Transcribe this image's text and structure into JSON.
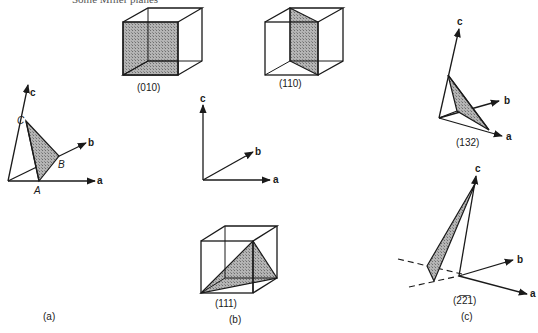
{
  "top_text": "Some Miller planes",
  "panel_a": {
    "caption": "(a)",
    "axes": {
      "a": "a",
      "b": "b",
      "c": "c"
    },
    "points": {
      "A": "A",
      "B": "B",
      "C": "C"
    }
  },
  "panel_b": {
    "caption": "(b)",
    "axes": {
      "a": "a",
      "b": "b",
      "c": "c"
    },
    "planes": [
      {
        "label": "(010)"
      },
      {
        "label": "(110)"
      },
      {
        "label": "(111)"
      }
    ]
  },
  "panel_c": {
    "caption": "(c)",
    "planes": [
      {
        "label": "(132)",
        "axes": {
          "a": "a",
          "b": "b",
          "c": "c"
        }
      },
      {
        "label": "(2̅2̅1)",
        "axes": {
          "a": "a",
          "b": "b",
          "c": "c"
        }
      }
    ]
  },
  "colors": {
    "ink": "#1a1a1a",
    "shade": "#9a9a9a",
    "background": "#ffffff"
  }
}
